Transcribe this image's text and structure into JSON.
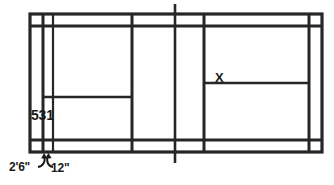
{
  "diagram": {
    "type": "line-diagram",
    "background_color": "#ffffff",
    "line_color": "#262626",
    "text_color": "#1a1a1a"
  },
  "labels": {
    "court_mark": "531",
    "position_marker": "X",
    "dimension_doubles_alley": "2'6\"",
    "dimension_line_width": "12\""
  },
  "annotations": [
    {
      "name": "doubles-sideline-width",
      "text": "2'6\"",
      "leader": "curved-arrow-up-right"
    },
    {
      "name": "line-width-callout",
      "text": "12\"",
      "leader": "curved-arrow-up-left"
    }
  ],
  "court_lines": {
    "outer_boundary": {
      "x1": 30,
      "y1": 14,
      "x2": 322,
      "y2": 152
    },
    "inner_sideline_left_x": 43,
    "inner_sideline_right_x": 309,
    "long_service_line_top_y": 26,
    "long_service_line_bottom_y": 140,
    "short_service_line_left_x": 132,
    "short_service_line_right_x": 204,
    "net_line_x": 175,
    "net_post_top_y": 4,
    "net_post_bottom_y": 163,
    "center_line_left_y": 97,
    "center_line_right_y": 83,
    "extra_vertical_left_x": 53
  }
}
